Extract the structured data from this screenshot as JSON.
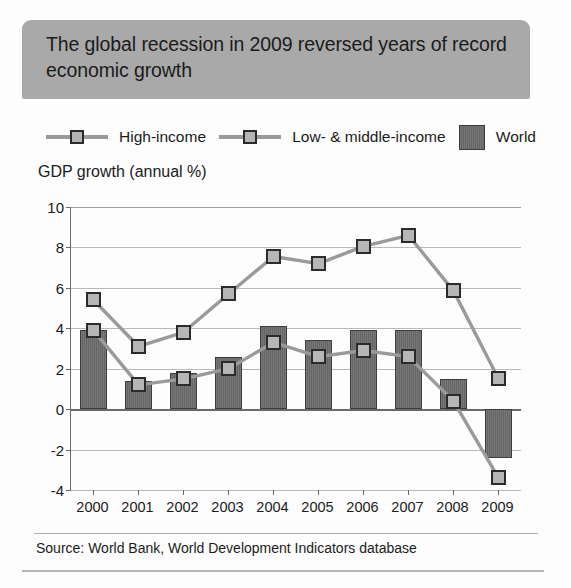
{
  "figure": {
    "title": "The global recession in 2009 reversed years of record economic growth",
    "source": "Source: World Bank, World Development Indicators database",
    "ylabel": "GDP growth (annual %)"
  },
  "legend": {
    "items": [
      {
        "label": "High-income",
        "marker": "line-square-marker",
        "color": "#b4b4b4"
      },
      {
        "label": "Low- & middle-income",
        "marker": "line-square-marker",
        "color": "#b4b4b4"
      },
      {
        "label": "World",
        "marker": "filled-square-swatch",
        "color": "#6e6e6e"
      }
    ]
  },
  "colors": {
    "header_band": "#a9a9a9",
    "bar_fill": "#6e6e6e",
    "line": "#9a9a9a",
    "marker_fill": "#b4b4b4",
    "marker_edge": "#2a2a2a",
    "gridline": "#b9b9b9",
    "axis": "#6a6a6a",
    "text": "#1b1b1b",
    "background": "#ffffff"
  },
  "chart_data": {
    "type": "bar",
    "title": "The global recession in 2009 reversed years of record economic growth",
    "subtitle": "",
    "xlabel": "",
    "ylabel": "GDP growth (annual %)",
    "categories": [
      "2000",
      "2001",
      "2002",
      "2003",
      "2004",
      "2005",
      "2006",
      "2007",
      "2008",
      "2009"
    ],
    "x": [
      2000,
      2001,
      2002,
      2003,
      2004,
      2005,
      2006,
      2007,
      2008,
      2009
    ],
    "ylim": [
      -4,
      10
    ],
    "yticks": [
      10,
      8,
      6,
      4,
      2,
      0,
      -2,
      -4
    ],
    "ytick_labels": [
      "10",
      "8",
      "6",
      "4",
      "2",
      "0",
      "-2",
      "-4"
    ],
    "grid": true,
    "legend_position": "above-plot",
    "series": [
      {
        "name": "World",
        "type": "bar",
        "values": [
          3.9,
          1.4,
          1.8,
          2.6,
          4.1,
          3.4,
          3.9,
          3.9,
          1.5,
          -2.4
        ]
      },
      {
        "name": "High-income",
        "type": "line",
        "marker": "square",
        "values": [
          3.9,
          1.2,
          1.5,
          2.0,
          3.3,
          2.6,
          2.9,
          2.6,
          0.4,
          -3.4
        ]
      },
      {
        "name": "Low- & middle-income",
        "type": "line",
        "marker": "square",
        "values": [
          5.4,
          3.1,
          3.8,
          5.7,
          7.55,
          7.2,
          8.05,
          8.6,
          5.85,
          1.5
        ]
      }
    ],
    "annotations": [],
    "source": "Source: World Bank, World Development Indicators database"
  }
}
